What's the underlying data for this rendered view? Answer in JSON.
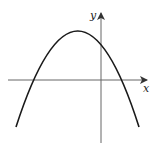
{
  "diagram": {
    "type": "coordinate-plane-parabola",
    "x_axis_label": "x",
    "y_axis_label": "y",
    "curve": {
      "shape": "downward-opening parabola",
      "vertex_position": "left of y-axis, above x-axis",
      "x_intercepts": "one negative, one positive",
      "y_intercept": "positive"
    },
    "colors": {
      "curve": "#1a1a1a",
      "axes": "#555555",
      "background": "#ffffff"
    }
  }
}
